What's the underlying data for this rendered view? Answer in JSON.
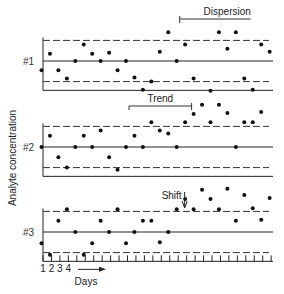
{
  "chart_data": {
    "type": "scatter",
    "title": "",
    "xlabel": "Days",
    "ylabel": "Analyte concentration",
    "x_tick_labels": [
      "1",
      "2",
      "3",
      "4"
    ],
    "n_days": 28,
    "control_limits_sd": [
      -2,
      2
    ],
    "mean_sd": 0,
    "panels": [
      {
        "name": "#1",
        "annotation": {
          "label": "Dispersion",
          "start_day": 17,
          "end_day": 26
        },
        "points": [
          [
            1,
            -0.9
          ],
          [
            2,
            0.7
          ],
          [
            3,
            -0.9
          ],
          [
            4,
            -1.7
          ],
          [
            5,
            0
          ],
          [
            6,
            1.6
          ],
          [
            7,
            0.7
          ],
          [
            8,
            0
          ],
          [
            9,
            0.8
          ],
          [
            10,
            -0.9
          ],
          [
            11,
            0
          ],
          [
            12,
            -1.6
          ],
          [
            13,
            -2.8
          ],
          [
            14,
            -2.0
          ],
          [
            15,
            0.9
          ],
          [
            16,
            2.8
          ],
          [
            17,
            0
          ],
          [
            18,
            1.6
          ],
          [
            19,
            -1.7
          ],
          [
            21,
            -2.9
          ],
          [
            22,
            2.8
          ],
          [
            23,
            1.2
          ],
          [
            24,
            2.8
          ],
          [
            25,
            -1.7
          ],
          [
            26,
            -2.8
          ],
          [
            27,
            1.6
          ],
          [
            28,
            0.9
          ]
        ]
      },
      {
        "name": "#2",
        "annotation": {
          "label": "Trend",
          "start_day": 11,
          "end_day": 19
        },
        "points": [
          [
            1,
            0
          ],
          [
            2,
            1.1
          ],
          [
            3,
            -1.0
          ],
          [
            4,
            -2.0
          ],
          [
            5,
            0
          ],
          [
            6,
            1.1
          ],
          [
            7,
            0
          ],
          [
            8,
            1.6
          ],
          [
            9,
            -1.0
          ],
          [
            10,
            -2.2
          ],
          [
            11,
            0
          ],
          [
            12,
            1.1
          ],
          [
            13,
            0
          ],
          [
            14,
            2.4
          ],
          [
            15,
            1.6
          ],
          [
            16,
            1.3
          ],
          [
            17,
            0
          ],
          [
            18,
            2.4
          ],
          [
            19,
            3.2
          ],
          [
            20,
            4.1
          ],
          [
            21,
            2.4
          ],
          [
            22,
            4.1
          ],
          [
            23,
            3.3
          ],
          [
            24,
            0
          ],
          [
            25,
            2.4
          ],
          [
            26,
            2.4
          ],
          [
            27,
            3.4
          ]
        ]
      },
      {
        "name": "#3",
        "annotation": {
          "label": "Shift",
          "day": 18
        },
        "points": [
          [
            1,
            -1.1
          ],
          [
            2,
            -2.2
          ],
          [
            3,
            1.1
          ],
          [
            4,
            2.2
          ],
          [
            5,
            0
          ],
          [
            6,
            -2.2
          ],
          [
            7,
            -1.1
          ],
          [
            8,
            1.1
          ],
          [
            9,
            0
          ],
          [
            10,
            2.2
          ],
          [
            11,
            -1.1
          ],
          [
            12,
            0
          ],
          [
            13,
            1.1
          ],
          [
            14,
            1.1
          ],
          [
            15,
            -1.0
          ],
          [
            16,
            0
          ],
          [
            17,
            2.2
          ],
          [
            18,
            3.2
          ],
          [
            19,
            2.2
          ],
          [
            20,
            4.1
          ],
          [
            21,
            3.2
          ],
          [
            22,
            2.2
          ],
          [
            23,
            4.2
          ],
          [
            24,
            1.1
          ],
          [
            25,
            3.6
          ],
          [
            26,
            2.3
          ],
          [
            27,
            1.2
          ],
          [
            28,
            3.3
          ]
        ]
      }
    ]
  }
}
